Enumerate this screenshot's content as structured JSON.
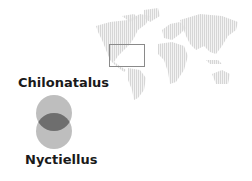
{
  "venn": {
    "top_label": "Chilonatalus",
    "bottom_label": "Nyctiellus",
    "circle_color": "#b0b0b0",
    "overlap_color": "#6e6e6e"
  },
  "map": {
    "description": "dotted world map",
    "land_color": "#dcdcdc",
    "highlight_region": "Caribbean / Central America",
    "highlight_box_color": "#888888"
  }
}
